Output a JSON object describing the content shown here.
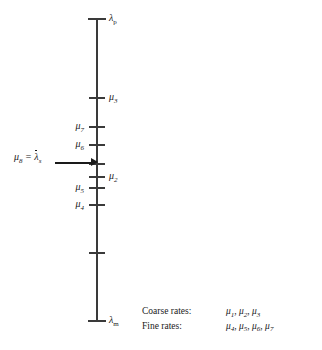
{
  "figure": {
    "type": "number-line-diagram",
    "orientation": "vertical",
    "axis": {
      "top_endpoint_label": "λ",
      "top_endpoint_sub": "p",
      "bottom_endpoint_label": "λ",
      "bottom_endpoint_sub": "m",
      "top_y": 18,
      "bottom_y": 320,
      "x": 96,
      "color": "#3a3a3a"
    },
    "ticks": [
      {
        "name": "lambda-p",
        "y": 18,
        "label": "λ",
        "sub": "p",
        "side": "right",
        "style": "cap"
      },
      {
        "name": "mu3",
        "y": 97,
        "label": "μ",
        "sub": "3",
        "side": "right",
        "style": "major"
      },
      {
        "name": "mu7",
        "y": 126,
        "label": "μ",
        "sub": "7",
        "side": "left",
        "style": "major"
      },
      {
        "name": "mu6",
        "y": 144,
        "label": "μ",
        "sub": "6",
        "side": "left",
        "style": "major"
      },
      {
        "name": "mu8",
        "y": 163,
        "label": "",
        "sub": "",
        "side": "none",
        "style": "major"
      },
      {
        "name": "mu2",
        "y": 176,
        "label": "μ",
        "sub": "2",
        "side": "right",
        "style": "major"
      },
      {
        "name": "mu5",
        "y": 187,
        "label": "μ",
        "sub": "5",
        "side": "left",
        "style": "major"
      },
      {
        "name": "mu4",
        "y": 204,
        "label": "μ",
        "sub": "4",
        "side": "left",
        "style": "major"
      },
      {
        "name": "mu1",
        "y": 252,
        "label": "",
        "sub": "",
        "side": "none",
        "style": "major"
      },
      {
        "name": "lambda-m",
        "y": 320,
        "label": "λ",
        "sub": "m",
        "side": "right",
        "style": "cap"
      }
    ],
    "callout": {
      "lhs": "μ",
      "lhs_sub": "8",
      "equals": " = ",
      "rhs": "λ",
      "rhs_sub": "s",
      "rhs_has_overbar": true,
      "arrow": "right-arrow"
    },
    "legend": {
      "rows": [
        {
          "name": "Coarse rates:",
          "values": "μ1, μ2, μ3"
        },
        {
          "name": "Fine rates:",
          "values": "μ4, μ5, μ6, μ7"
        }
      ]
    }
  }
}
